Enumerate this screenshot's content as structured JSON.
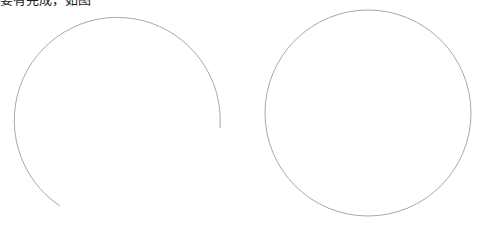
{
  "caption": "要有完成，如图 ······",
  "figure": {
    "stroke_color": "#a8a8a8",
    "left_arc": {
      "cx": 118,
      "cy": 125,
      "r": 103,
      "label": "open arc (about 3/4 circle)"
    },
    "right_circle": {
      "cx": 368,
      "cy": 113,
      "r": 103,
      "label": "full circle"
    }
  }
}
